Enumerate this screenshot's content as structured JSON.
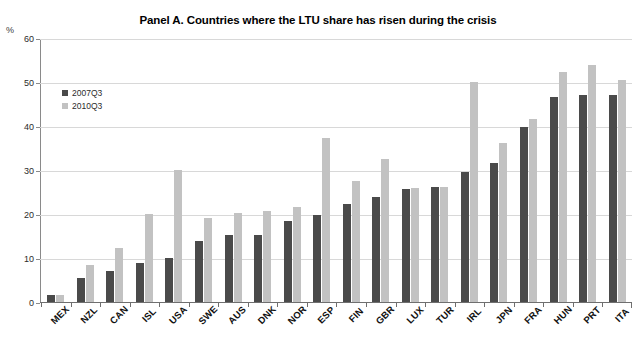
{
  "page": {
    "cut_header_text": "",
    "unit_label": "%"
  },
  "legend": {
    "position": "inside-top-left",
    "items": [
      {
        "label": "2007Q3",
        "color": "#4a4a4a"
      },
      {
        "label": "2010Q3",
        "color": "#c2c2c2"
      }
    ]
  },
  "axis": {
    "y_ticks": [
      60,
      50,
      40,
      30,
      20,
      10,
      0
    ],
    "y_tick_labels": [
      "60",
      "50",
      "40",
      "30",
      "20",
      "10",
      "0"
    ]
  },
  "chart_data": {
    "type": "bar",
    "title": "Panel A. Countries where the LTU share has risen during the crisis",
    "xlabel": "",
    "ylabel": "%",
    "ylim": [
      0,
      60
    ],
    "grid": true,
    "legend_position": "inside-top-left",
    "categories": [
      "MEX",
      "NZL",
      "CAN",
      "ISL",
      "USA",
      "SWE",
      "AUS",
      "DNK",
      "NOR",
      "ESP",
      "FIN",
      "GBR",
      "LUX",
      "TUR",
      "IRL",
      "JPN",
      "FRA",
      "HUN",
      "PRT",
      "ITA"
    ],
    "series": [
      {
        "name": "2007Q3",
        "color": "#4a4a4a",
        "values": [
          1.7,
          5.5,
          7.0,
          8.8,
          10.0,
          13.9,
          15.2,
          15.3,
          18.5,
          19.8,
          22.3,
          23.9,
          25.6,
          26.1,
          29.5,
          31.5,
          39.8,
          46.5,
          47.1,
          47.0
        ]
      },
      {
        "name": "2010Q3",
        "color": "#c2c2c2",
        "values": [
          1.7,
          8.5,
          12.3,
          20.0,
          30.1,
          19.1,
          20.2,
          20.6,
          21.5,
          37.2,
          27.5,
          32.4,
          26.0,
          26.2,
          50.0,
          36.2,
          41.7,
          52.3,
          53.8,
          50.4
        ]
      }
    ]
  }
}
